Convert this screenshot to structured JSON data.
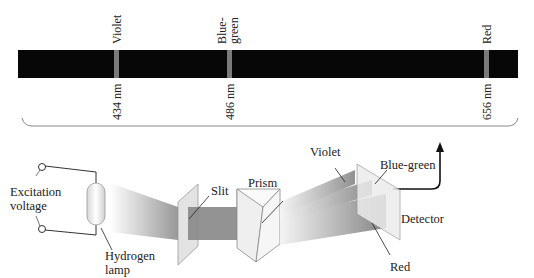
{
  "spectrum": {
    "lines": [
      {
        "name": "Violet",
        "wavelength": "434 nm",
        "color": "#7a7a7a"
      },
      {
        "name": "Blue-green",
        "name_line1": "Blue-",
        "name_line2": "green",
        "wavelength": "486 nm",
        "color": "#7a7a7a"
      },
      {
        "name": "Red",
        "wavelength": "656 nm",
        "color": "#7a7a7a"
      }
    ],
    "background": "#070707"
  },
  "apparatus": {
    "excitation_line1": "Excitation",
    "excitation_line2": "voltage",
    "lamp_line1": "Hydrogen",
    "lamp_line2": "lamp",
    "slit": "Slit",
    "prism": "Prism",
    "violet": "Violet",
    "blue_green": "Blue-green",
    "detector": "Detector",
    "red": "Red"
  }
}
